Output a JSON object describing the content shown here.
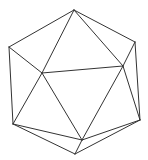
{
  "diagram": {
    "shape": "icosahedron wireframe",
    "stroke_color": "#333333",
    "background": "#ffffff",
    "vertices": {
      "top": [
        74,
        10
      ],
      "upper_left": [
        9,
        47
      ],
      "upper_right": [
        135,
        42
      ],
      "inner_left": [
        42,
        73
      ],
      "inner_right": [
        123,
        66
      ],
      "lower_left": [
        13,
        124
      ],
      "lower_right": [
        140,
        120
      ],
      "inner_bottom": [
        82,
        140
      ],
      "bottom": [
        75,
        154
      ]
    },
    "edges": [
      [
        "top",
        "upper_left"
      ],
      [
        "top",
        "upper_right"
      ],
      [
        "top",
        "inner_left"
      ],
      [
        "top",
        "inner_right"
      ],
      [
        "upper_left",
        "inner_left"
      ],
      [
        "upper_left",
        "lower_left"
      ],
      [
        "upper_right",
        "inner_right"
      ],
      [
        "upper_right",
        "lower_right"
      ],
      [
        "inner_left",
        "inner_right"
      ],
      [
        "inner_left",
        "lower_left"
      ],
      [
        "inner_left",
        "inner_bottom"
      ],
      [
        "inner_right",
        "inner_bottom"
      ],
      [
        "inner_right",
        "lower_right"
      ],
      [
        "lower_left",
        "inner_bottom"
      ],
      [
        "lower_left",
        "bottom"
      ],
      [
        "lower_right",
        "inner_bottom"
      ],
      [
        "lower_right",
        "bottom"
      ],
      [
        "inner_bottom",
        "bottom"
      ]
    ]
  }
}
